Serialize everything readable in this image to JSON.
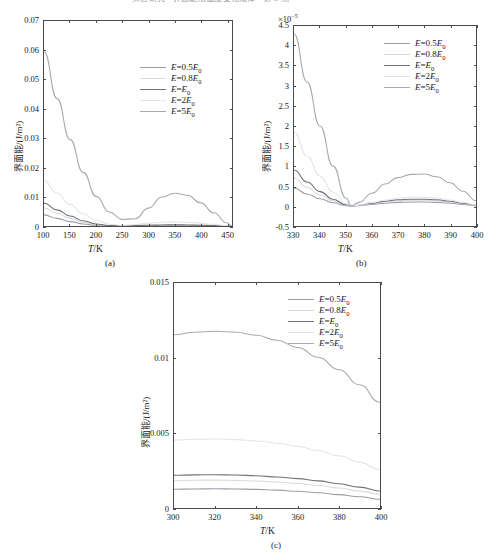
{
  "header": {
    "text": "实验研究 · 界面能随温度变化规律 · 第 3 期"
  },
  "series_colors": [
    "#9a9ea6",
    "#d8dade",
    "#6f7378",
    "#e3e5e8",
    "#a6aab0"
  ],
  "legend_labels": [
    "E=0.5E0",
    "E=0.8E0",
    "E=E0",
    "E=2E0",
    "E=5E0"
  ],
  "legend": [
    {
      "prefix": "E",
      "eq": "=",
      "coef": "0.5",
      "base": "E",
      "sub": "0"
    },
    {
      "prefix": "E",
      "eq": "=",
      "coef": "0.8",
      "base": "E",
      "sub": "0"
    },
    {
      "prefix": "E",
      "eq": "=",
      "coef": "",
      "base": "E",
      "sub": "0"
    },
    {
      "prefix": "E",
      "eq": "=",
      "coef": "2",
      "base": "E",
      "sub": "0"
    },
    {
      "prefix": "E",
      "eq": "=",
      "coef": "5",
      "base": "E",
      "sub": "0"
    }
  ],
  "axis_titles": {
    "x": "T/K",
    "x_var": "T",
    "x_unit": "/K",
    "y": "界面能/(J/m²)"
  },
  "captions": {
    "a": "(a)",
    "b": "(b)",
    "c": "(c)"
  },
  "chart_data": [
    {
      "id": "a",
      "type": "line",
      "title": "",
      "caption": "(a)",
      "xlabel": "T/K",
      "ylabel": "界面能/(J/m²)",
      "xlim": [
        100,
        460
      ],
      "ylim": [
        0,
        0.07
      ],
      "xticks": [
        100,
        150,
        200,
        250,
        300,
        350,
        400,
        450
      ],
      "yticks": [
        0,
        0.01,
        0.02,
        0.03,
        0.04,
        0.05,
        0.06,
        0.07
      ],
      "ytick_labels": [
        "0",
        "0.01",
        "0.02",
        "0.03",
        "0.04",
        "0.05",
        "0.06",
        "0.07"
      ],
      "exponent": "",
      "grid": false,
      "legend_position": "upper-right",
      "x": [
        100,
        125,
        150,
        175,
        200,
        225,
        250,
        275,
        300,
        325,
        350,
        375,
        400,
        425,
        450,
        460
      ],
      "series": [
        {
          "name": "E=0.5E0",
          "values": [
            0.0038,
            0.0026,
            0.0015,
            0.0007,
            0.00025,
            8e-05,
            4e-05,
            7e-05,
            0.00012,
            0.00016,
            0.00017,
            0.00016,
            0.00012,
            7e-05,
            2e-05,
            0.0
          ]
        },
        {
          "name": "E=0.8E0",
          "values": [
            0.0062,
            0.0043,
            0.0026,
            0.0013,
            0.0005,
            0.00012,
            5e-05,
            0.00011,
            0.0002,
            0.00027,
            0.0003,
            0.00028,
            0.00021,
            0.00012,
            3e-05,
            0.0
          ]
        },
        {
          "name": "E=E0",
          "values": [
            0.0078,
            0.0055,
            0.0034,
            0.0018,
            0.0007,
            0.00018,
            6e-05,
            0.00014,
            0.00026,
            0.00035,
            0.00039,
            0.00036,
            0.00027,
            0.00015,
            4e-05,
            0.0
          ]
        },
        {
          "name": "E=2E0",
          "values": [
            0.0155,
            0.0112,
            0.0073,
            0.0042,
            0.0019,
            0.0006,
            0.0002,
            0.0005,
            0.00095,
            0.00128,
            0.0014,
            0.0013,
            0.00098,
            0.00055,
            0.00013,
            0.0
          ]
        },
        {
          "name": "E=5E0",
          "values": [
            0.0595,
            0.0435,
            0.0295,
            0.0183,
            0.0101,
            0.0048,
            0.0022,
            0.0025,
            0.0061,
            0.0098,
            0.0112,
            0.0105,
            0.0079,
            0.0045,
            0.0011,
            0.0
          ]
        }
      ]
    },
    {
      "id": "b",
      "type": "line",
      "title": "",
      "caption": "(b)",
      "xlabel": "T/K",
      "ylabel": "界面能/(J/m²)",
      "exponent": "×10⁻⁵",
      "exponent_mantissa": "×10",
      "exponent_power": "-5",
      "xlim": [
        330,
        400
      ],
      "ylim": [
        -0.5,
        4.5
      ],
      "xticks": [
        330,
        340,
        350,
        360,
        370,
        380,
        390,
        400
      ],
      "yticks": [
        -0.5,
        0,
        0.5,
        1,
        1.5,
        2,
        2.5,
        3,
        3.5,
        4,
        4.5
      ],
      "ytick_labels": [
        "-0.5",
        "0",
        "0.5",
        "1",
        "1.5",
        "2",
        "2.5",
        "3",
        "3.5",
        "4",
        "4.5"
      ],
      "grid": false,
      "legend_position": "upper-right",
      "x": [
        330,
        335,
        340,
        345,
        350,
        352,
        355,
        360,
        365,
        370,
        375,
        380,
        385,
        390,
        395,
        400
      ],
      "series": [
        {
          "name": "E=0.5E0",
          "values": [
            0.45,
            0.3,
            0.18,
            0.08,
            0.01,
            0.0,
            0.01,
            0.04,
            0.07,
            0.09,
            0.1,
            0.1,
            0.09,
            0.07,
            0.04,
            0.01
          ]
        },
        {
          "name": "E=0.8E0",
          "values": [
            0.7,
            0.47,
            0.28,
            0.13,
            0.02,
            0.0,
            0.015,
            0.06,
            0.1,
            0.13,
            0.145,
            0.145,
            0.13,
            0.1,
            0.06,
            0.015
          ]
        },
        {
          "name": "E=E0",
          "values": [
            0.9,
            0.6,
            0.36,
            0.17,
            0.03,
            0.0,
            0.018,
            0.07,
            0.12,
            0.155,
            0.17,
            0.17,
            0.155,
            0.12,
            0.07,
            0.02
          ]
        },
        {
          "name": "E=2E0",
          "values": [
            1.85,
            1.25,
            0.75,
            0.35,
            0.06,
            0.0,
            0.02,
            0.09,
            0.15,
            0.2,
            0.22,
            0.22,
            0.2,
            0.15,
            0.09,
            0.025
          ]
        },
        {
          "name": "E=5E0",
          "values": [
            4.3,
            3.1,
            2.0,
            1.0,
            0.2,
            0.0,
            0.09,
            0.32,
            0.55,
            0.71,
            0.79,
            0.8,
            0.73,
            0.58,
            0.37,
            0.13
          ]
        }
      ]
    },
    {
      "id": "c",
      "type": "line",
      "title": "",
      "caption": "(c)",
      "xlabel": "T/K",
      "ylabel": "界面能/(J/m²)",
      "exponent": "",
      "xlim": [
        300,
        400
      ],
      "ylim": [
        0,
        0.015
      ],
      "xticks": [
        300,
        320,
        340,
        360,
        380,
        400
      ],
      "yticks": [
        0,
        0.005,
        0.01,
        0.015
      ],
      "ytick_labels": [
        "0",
        "0.005",
        "0.01",
        "0.015"
      ],
      "grid": false,
      "legend_position": "upper-right",
      "x": [
        300,
        310,
        320,
        330,
        340,
        350,
        360,
        370,
        380,
        390,
        400
      ],
      "series": [
        {
          "name": "E=0.5E0",
          "values": [
            0.00125,
            0.00127,
            0.00128,
            0.00127,
            0.00124,
            0.00119,
            0.00112,
            0.00102,
            0.00089,
            0.00075,
            0.00058
          ]
        },
        {
          "name": "E=0.8E0",
          "values": [
            0.00182,
            0.00185,
            0.00186,
            0.00184,
            0.0018,
            0.00173,
            0.00163,
            0.0015,
            0.00133,
            0.00113,
            0.00092
          ]
        },
        {
          "name": "E=E0",
          "values": [
            0.00218,
            0.00221,
            0.00222,
            0.0022,
            0.00215,
            0.00207,
            0.00196,
            0.00181,
            0.00162,
            0.00139,
            0.00113
          ]
        },
        {
          "name": "E=2E0",
          "values": [
            0.00452,
            0.00458,
            0.0046,
            0.00456,
            0.00447,
            0.00432,
            0.00411,
            0.00383,
            0.00348,
            0.00305,
            0.00255
          ]
        },
        {
          "name": "E=5E0",
          "values": [
            0.01155,
            0.01172,
            0.01178,
            0.01172,
            0.01152,
            0.01118,
            0.0107,
            0.01005,
            0.00922,
            0.00822,
            0.00705
          ]
        }
      ]
    }
  ]
}
